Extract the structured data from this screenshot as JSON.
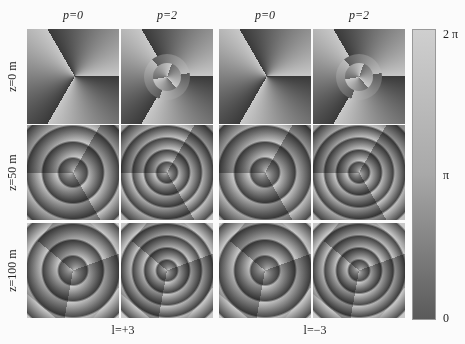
{
  "figure": {
    "column_labels": [
      "p=0",
      "p=2",
      "p=0",
      "p=2"
    ],
    "row_labels": [
      "z=0 m",
      "z=50 m",
      "z=100 m"
    ],
    "group_labels": [
      "l=+3",
      "l=−3"
    ],
    "colorbar": {
      "ticks": [
        "2 π",
        "π",
        "0"
      ],
      "gradient": [
        "#cfcfcf",
        "#a8a8a8",
        "#5a5a5a"
      ]
    },
    "panels": [
      {
        "row": "z=0 m",
        "col": "p=0",
        "group": "l=+3",
        "pattern": "three-sector phase"
      },
      {
        "row": "z=0 m",
        "col": "p=2",
        "group": "l=+3",
        "pattern": "three-sector phase with central rings"
      },
      {
        "row": "z=0 m",
        "col": "p=0",
        "group": "l=−3",
        "pattern": "three-sector phase"
      },
      {
        "row": "z=0 m",
        "col": "p=2",
        "group": "l=−3",
        "pattern": "three-sector phase with central rings"
      },
      {
        "row": "z=50 m",
        "col": "p=0",
        "group": "l=+3",
        "pattern": "three-arm spiral"
      },
      {
        "row": "z=50 m",
        "col": "p=2",
        "group": "l=+3",
        "pattern": "spiral with nested rings"
      },
      {
        "row": "z=50 m",
        "col": "p=0",
        "group": "l=−3",
        "pattern": "three-arm spiral"
      },
      {
        "row": "z=50 m",
        "col": "p=2",
        "group": "l=−3",
        "pattern": "spiral with nested rings"
      },
      {
        "row": "z=100 m",
        "col": "p=0",
        "group": "l=+3",
        "pattern": "three-arm spiral"
      },
      {
        "row": "z=100 m",
        "col": "p=2",
        "group": "l=+3",
        "pattern": "spiral with nested rings"
      },
      {
        "row": "z=100 m",
        "col": "p=0",
        "group": "l=−3",
        "pattern": "three-arm spiral"
      },
      {
        "row": "z=100 m",
        "col": "p=2",
        "group": "l=−3",
        "pattern": "spiral with nested rings"
      }
    ]
  }
}
